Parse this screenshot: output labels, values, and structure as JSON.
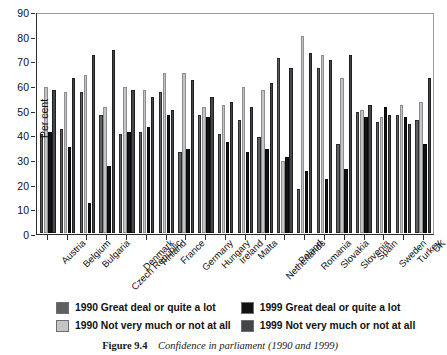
{
  "chart_data": {
    "type": "bar",
    "title": "",
    "xlabel": "",
    "ylabel": "Per cent",
    "ylim": [
      0,
      90
    ],
    "yticks": [
      0,
      10,
      20,
      30,
      40,
      50,
      60,
      70,
      80,
      90
    ],
    "grid": false,
    "legend_position": "below-axes",
    "categories": [
      "Austria",
      "Belgium",
      "Bulgaria",
      "Czech Republic",
      "Denmark",
      "Finland",
      "France",
      "Germany",
      "Hungary",
      "Ireland",
      "Malta",
      "Netherlands",
      "Poland",
      "Romania",
      "Slovakia",
      "Slovenia",
      "Spain",
      "Sweden",
      "Turkey",
      "UK"
    ],
    "series": [
      {
        "name": "1990 Great deal or quite a lot",
        "color": "#5f6062",
        "values": [
          40,
          42,
          57,
          48,
          40,
          41,
          57,
          33,
          48,
          40,
          46,
          39,
          71,
          18,
          67,
          36,
          49,
          45,
          48,
          46
        ]
      },
      {
        "name": "1990 Not very much or not at all",
        "color": "#c3c4c5",
        "values": [
          59,
          57,
          64,
          51,
          59,
          58,
          65,
          65,
          51,
          52,
          59,
          58,
          29,
          80,
          72,
          63,
          50,
          47,
          52,
          53
        ]
      },
      {
        "name": "1999 Great deal or quite a lot",
        "color": "#111214",
        "values": [
          41,
          35,
          12,
          27,
          41,
          43,
          48,
          34,
          47,
          37,
          33,
          34,
          31,
          25,
          22,
          26,
          47,
          51,
          47,
          36
        ]
      },
      {
        "name": "1999 Not very much or not at all",
        "color": "#45464a",
        "values": [
          58,
          63,
          72,
          74,
          58,
          55,
          50,
          62,
          55,
          53,
          51,
          61,
          67,
          73,
          70,
          72,
          52,
          48,
          44,
          63
        ]
      }
    ]
  },
  "axis": {
    "y_title": "Per cent"
  },
  "legend": {
    "items": [
      {
        "label": "1990 Great deal or quite a lot",
        "swatch": "#5f6062"
      },
      {
        "label": "1999 Great deal or quite a lot",
        "swatch": "#111214"
      },
      {
        "label": "1990 Not very much or not at all",
        "swatch": "#c3c4c5"
      },
      {
        "label": "1999 Not very much or not at all",
        "swatch": "#45464a"
      }
    ]
  },
  "caption": {
    "number": "Figure 9.4",
    "title": "Confidence in parliament (1990 and 1999)"
  }
}
